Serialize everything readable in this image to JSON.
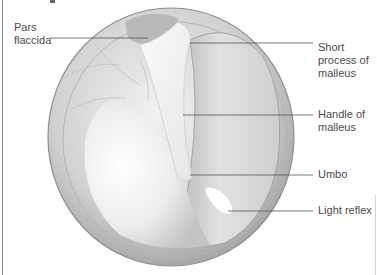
{
  "figure": {
    "colors": {
      "leader_line": "#555555",
      "label_text": "#4a4a4a",
      "rim": "#9a9a9a",
      "membrane_light": "#f4f4f4",
      "membrane_shadow": "#bdbdbd"
    }
  },
  "labels": {
    "pars_flaccida": [
      "Pars",
      "flaccida"
    ],
    "short_process": [
      "Short",
      "process of",
      "malleus"
    ],
    "handle": [
      "Handle of",
      "malleus"
    ],
    "umbo": [
      "Umbo"
    ],
    "light_reflex": [
      "Light reflex"
    ]
  }
}
